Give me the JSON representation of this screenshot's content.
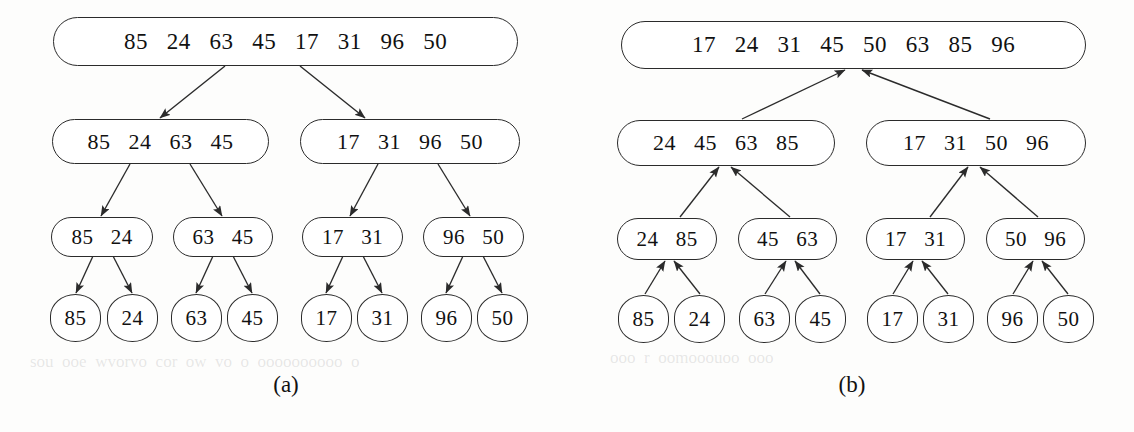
{
  "figure": {
    "panels": [
      {
        "id": "a",
        "caption": "(a)",
        "phase": "divide",
        "levels": [
          {
            "level": 0,
            "nodes": [
              {
                "values": [
                  "85",
                  "24",
                  "63",
                  "45",
                  "17",
                  "31",
                  "96",
                  "50"
                ],
                "text": "85   24   63   45   17   31   96   50"
              }
            ]
          },
          {
            "level": 1,
            "nodes": [
              {
                "values": [
                  "85",
                  "24",
                  "63",
                  "45"
                ],
                "text": "85   24   63   45"
              },
              {
                "values": [
                  "17",
                  "31",
                  "96",
                  "50"
                ],
                "text": "17   31   96   50"
              }
            ]
          },
          {
            "level": 2,
            "nodes": [
              {
                "values": [
                  "85",
                  "24"
                ],
                "text": "85   24"
              },
              {
                "values": [
                  "63",
                  "45"
                ],
                "text": "63   45"
              },
              {
                "values": [
                  "17",
                  "31"
                ],
                "text": "17   31"
              },
              {
                "values": [
                  "96",
                  "50"
                ],
                "text": "96   50"
              }
            ]
          },
          {
            "level": 3,
            "nodes": [
              {
                "values": [
                  "85"
                ],
                "text": "85"
              },
              {
                "values": [
                  "24"
                ],
                "text": "24"
              },
              {
                "values": [
                  "63"
                ],
                "text": "63"
              },
              {
                "values": [
                  "45"
                ],
                "text": "45"
              },
              {
                "values": [
                  "17"
                ],
                "text": "17"
              },
              {
                "values": [
                  "31"
                ],
                "text": "31"
              },
              {
                "values": [
                  "96"
                ],
                "text": "96"
              },
              {
                "values": [
                  "50"
                ],
                "text": "50"
              }
            ]
          }
        ]
      },
      {
        "id": "b",
        "caption": "(b)",
        "phase": "merge",
        "levels": [
          {
            "level": 0,
            "nodes": [
              {
                "values": [
                  "17",
                  "24",
                  "31",
                  "45",
                  "50",
                  "63",
                  "85",
                  "96"
                ],
                "text": "17   24   31   45   50   63   85   96"
              }
            ]
          },
          {
            "level": 1,
            "nodes": [
              {
                "values": [
                  "24",
                  "45",
                  "63",
                  "85"
                ],
                "text": "24   45   63   85"
              },
              {
                "values": [
                  "17",
                  "31",
                  "50",
                  "96"
                ],
                "text": "17   31   50   96"
              }
            ]
          },
          {
            "level": 2,
            "nodes": [
              {
                "values": [
                  "24",
                  "85"
                ],
                "text": "24   85"
              },
              {
                "values": [
                  "45",
                  "63"
                ],
                "text": "45   63"
              },
              {
                "values": [
                  "17",
                  "31"
                ],
                "text": "17   31"
              },
              {
                "values": [
                  "50",
                  "96"
                ],
                "text": "50   96"
              }
            ]
          },
          {
            "level": 3,
            "nodes": [
              {
                "values": [
                  "85"
                ],
                "text": "85"
              },
              {
                "values": [
                  "24"
                ],
                "text": "24"
              },
              {
                "values": [
                  "63"
                ],
                "text": "63"
              },
              {
                "values": [
                  "45"
                ],
                "text": "45"
              },
              {
                "values": [
                  "17"
                ],
                "text": "17"
              },
              {
                "values": [
                  "31"
                ],
                "text": "31"
              },
              {
                "values": [
                  "96"
                ],
                "text": "96"
              },
              {
                "values": [
                  "50"
                ],
                "text": "50"
              }
            ]
          }
        ]
      }
    ],
    "colors": {
      "stroke": "#2b2b2b",
      "fill": "#ffffff",
      "text": "#111111",
      "background": "#fdfdfc"
    }
  }
}
